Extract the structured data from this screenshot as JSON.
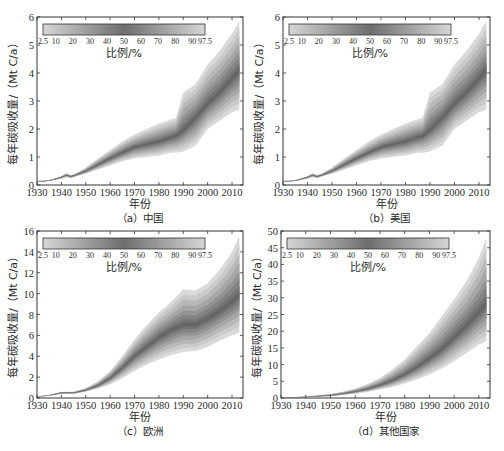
{
  "chart_data": [
    {
      "type": "area",
      "panel": "a",
      "caption": "（a）中国",
      "xlabel": "年份",
      "ylabel": "每年碳吸收量/（Mt C/a）",
      "xlim": [
        1930,
        2014.5
      ],
      "ylim": [
        0,
        6
      ],
      "xticks": [
        1930,
        1940,
        1950,
        1960,
        1970,
        1980,
        1990,
        2000,
        2010
      ],
      "yticks": [
        0,
        1,
        2,
        3,
        4,
        5,
        6
      ],
      "colorbar": {
        "label": "比例/%",
        "ticks": [
          "2.5",
          "10",
          "20",
          "30",
          "40",
          "50",
          "60",
          "70",
          "80",
          "90",
          "97.5"
        ]
      },
      "x": [
        1930,
        1933,
        1936,
        1940,
        1942,
        1944,
        1946,
        1950,
        1955,
        1960,
        1965,
        1970,
        1975,
        1980,
        1985,
        1987,
        1990,
        1995,
        2000,
        2005,
        2010,
        2013
      ],
      "series": [
        {
          "name": "p2.5",
          "values": [
            0.12,
            0.12,
            0.15,
            0.22,
            0.28,
            0.25,
            0.3,
            0.4,
            0.55,
            0.7,
            0.85,
            0.95,
            1.0,
            1.05,
            1.15,
            1.15,
            1.2,
            1.4,
            2.0,
            2.3,
            2.6,
            2.7
          ]
        },
        {
          "name": "p50",
          "values": [
            0.14,
            0.14,
            0.18,
            0.28,
            0.35,
            0.3,
            0.36,
            0.5,
            0.72,
            0.95,
            1.15,
            1.35,
            1.45,
            1.55,
            1.7,
            1.75,
            1.95,
            2.4,
            2.9,
            3.3,
            3.8,
            4.1
          ]
        },
        {
          "name": "p97.5",
          "values": [
            0.15,
            0.16,
            0.2,
            0.32,
            0.42,
            0.36,
            0.42,
            0.62,
            0.95,
            1.25,
            1.55,
            1.8,
            2.0,
            2.2,
            2.35,
            2.4,
            3.3,
            3.6,
            4.3,
            4.8,
            5.4,
            5.85
          ]
        }
      ]
    },
    {
      "type": "area",
      "panel": "b",
      "caption": "（b）美国",
      "xlabel": "年份",
      "ylabel": "每年碳吸收量/（Mt C/a）",
      "xlim": [
        1930,
        2014.5
      ],
      "ylim": [
        0,
        6
      ],
      "xticks": [
        1930,
        1940,
        1950,
        1960,
        1970,
        1980,
        1990,
        2000,
        2010
      ],
      "yticks": [
        0,
        1,
        2,
        3,
        4,
        5,
        6
      ],
      "colorbar": {
        "label": "比例/%",
        "ticks": [
          "2.5",
          "10",
          "20",
          "30",
          "40",
          "50",
          "60",
          "70",
          "80",
          "90",
          "97.5"
        ]
      },
      "x": [
        1930,
        1933,
        1936,
        1940,
        1942,
        1944,
        1946,
        1950,
        1955,
        1960,
        1965,
        1970,
        1975,
        1980,
        1985,
        1987,
        1990,
        1995,
        2000,
        2005,
        2010,
        2013
      ],
      "series": [
        {
          "name": "p2.5",
          "values": [
            0.12,
            0.12,
            0.15,
            0.22,
            0.28,
            0.25,
            0.3,
            0.4,
            0.55,
            0.7,
            0.85,
            0.95,
            1.0,
            1.05,
            1.15,
            1.15,
            1.2,
            1.4,
            2.0,
            2.3,
            2.6,
            2.7
          ]
        },
        {
          "name": "p50",
          "values": [
            0.14,
            0.14,
            0.18,
            0.28,
            0.35,
            0.3,
            0.36,
            0.5,
            0.72,
            0.95,
            1.15,
            1.35,
            1.45,
            1.55,
            1.7,
            1.75,
            1.95,
            2.4,
            2.9,
            3.3,
            3.8,
            4.1
          ]
        },
        {
          "name": "p97.5",
          "values": [
            0.15,
            0.16,
            0.2,
            0.32,
            0.42,
            0.36,
            0.42,
            0.62,
            0.95,
            1.25,
            1.55,
            1.8,
            2.0,
            2.2,
            2.35,
            2.4,
            3.3,
            3.6,
            4.3,
            4.8,
            5.4,
            5.85
          ]
        }
      ]
    },
    {
      "type": "area",
      "panel": "c",
      "caption": "（c）欧洲",
      "xlabel": "年份",
      "ylabel": "每年碳吸收量/（Mt C/a）",
      "xlim": [
        1930,
        2014.5
      ],
      "ylim": [
        0,
        16
      ],
      "xticks": [
        1930,
        1940,
        1950,
        1960,
        1970,
        1980,
        1990,
        2000,
        2010
      ],
      "yticks": [
        0,
        2,
        4,
        6,
        8,
        10,
        12,
        14,
        16
      ],
      "colorbar": {
        "label": "比例/%",
        "ticks": [
          "2.5",
          "10",
          "20",
          "30",
          "40",
          "50",
          "60",
          "70",
          "80",
          "90",
          "97.5"
        ]
      },
      "x": [
        1930,
        1935,
        1940,
        1945,
        1950,
        1955,
        1960,
        1965,
        1970,
        1975,
        1980,
        1985,
        1990,
        1995,
        2000,
        2005,
        2010,
        2013
      ],
      "series": [
        {
          "name": "p2.5",
          "values": [
            0.1,
            0.2,
            0.4,
            0.4,
            0.6,
            0.9,
            1.3,
            1.9,
            2.6,
            3.2,
            3.7,
            4.1,
            4.4,
            4.5,
            4.9,
            5.5,
            6.0,
            6.3
          ]
        },
        {
          "name": "p50",
          "values": [
            0.12,
            0.25,
            0.5,
            0.5,
            0.75,
            1.2,
            1.9,
            2.9,
            4.0,
            4.9,
            5.8,
            6.5,
            7.0,
            7.0,
            7.6,
            8.3,
            9.2,
            9.8
          ]
        },
        {
          "name": "p97.5",
          "values": [
            0.15,
            0.3,
            0.6,
            0.6,
            0.95,
            1.6,
            2.6,
            4.0,
            5.6,
            7.0,
            8.2,
            9.2,
            10.4,
            10.3,
            11.0,
            12.3,
            14.0,
            15.5
          ]
        }
      ]
    },
    {
      "type": "area",
      "panel": "d",
      "caption": "（d）其他国家",
      "xlabel": "年份",
      "ylabel": "每年碳吸收量/（Mt C/a）",
      "xlim": [
        1930,
        2014.5
      ],
      "ylim": [
        0,
        50
      ],
      "xticks": [
        1930,
        1940,
        1950,
        1960,
        1970,
        1980,
        1990,
        2000,
        2010
      ],
      "yticks": [
        0,
        5,
        10,
        15,
        20,
        25,
        30,
        35,
        40,
        45,
        50
      ],
      "colorbar": {
        "label": "比例/%",
        "ticks": [
          "2.5",
          "10",
          "20",
          "30",
          "40",
          "50",
          "60",
          "70",
          "80",
          "90",
          "97.5"
        ]
      },
      "x": [
        1930,
        1940,
        1950,
        1955,
        1960,
        1965,
        1970,
        1975,
        1980,
        1985,
        1990,
        1995,
        2000,
        2005,
        2010,
        2013
      ],
      "series": [
        {
          "name": "p2.5",
          "values": [
            0.05,
            0.2,
            0.5,
            0.9,
            1.3,
            1.8,
            2.5,
            3.3,
            4.3,
            5.5,
            7.0,
            8.8,
            11.0,
            13.5,
            16.0,
            17.0
          ]
        },
        {
          "name": "p50",
          "values": [
            0.07,
            0.3,
            0.8,
            1.3,
            1.9,
            2.7,
            3.8,
            5.2,
            7.0,
            9.2,
            11.8,
            14.5,
            18.0,
            21.5,
            25.5,
            28.0
          ]
        },
        {
          "name": "p97.5",
          "values": [
            0.1,
            0.45,
            1.2,
            1.9,
            2.8,
            4.2,
            6.0,
            8.5,
            11.5,
            15.5,
            19.5,
            24.5,
            29.5,
            35.0,
            42.0,
            48.0
          ]
        }
      ]
    }
  ]
}
